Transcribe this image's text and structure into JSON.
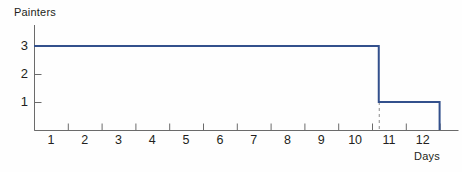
{
  "chart_data": {
    "type": "line",
    "subtype": "step",
    "title": "",
    "xlabel": "Days",
    "ylabel": "Painters",
    "xlim": [
      0,
      12.5
    ],
    "ylim": [
      0,
      3.4
    ],
    "grid": false,
    "legend": null,
    "x_tick_labels": [
      "1",
      "2",
      "3",
      "4",
      "5",
      "6",
      "7",
      "8",
      "9",
      "10",
      "11",
      "12"
    ],
    "y_tick_labels": [
      "1",
      "2",
      "3"
    ],
    "x_tick_values": [
      1,
      2,
      3,
      4,
      5,
      6,
      7,
      8,
      9,
      10,
      11,
      12
    ],
    "y_tick_values": [
      1,
      2,
      3
    ],
    "series": [
      {
        "name": "Painters on site",
        "style": "step-post",
        "color": "#33508c",
        "points": [
          {
            "x": 0,
            "y": 3
          },
          {
            "x": 10.2,
            "y": 3
          },
          {
            "x": 10.2,
            "y": 1
          },
          {
            "x": 12.0,
            "y": 1
          },
          {
            "x": 12.0,
            "y": 0
          }
        ]
      }
    ],
    "annotations": [
      {
        "type": "dashed-vertical-line",
        "x": 10.2,
        "y_from": 1,
        "y_to": 0,
        "color": "#8c8c8c"
      }
    ],
    "axis_color": "#6b6b6b",
    "text_color": "#231f20"
  },
  "labels": {
    "y_axis_title": "Painters",
    "x_axis_title": "Days"
  }
}
